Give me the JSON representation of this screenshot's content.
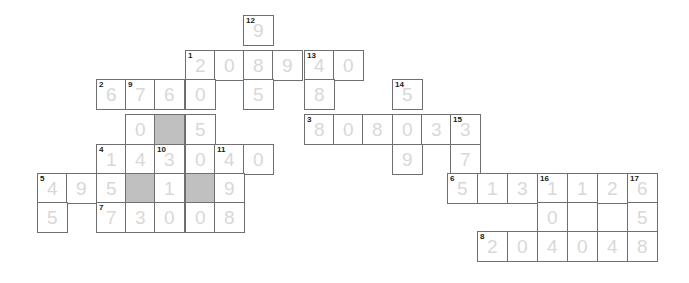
{
  "puzzle": {
    "name": "crossnumber-grid",
    "cell_size": 29.5,
    "colors": {
      "grid_line": "#6f6f6f",
      "digit": "#d8d8d8",
      "clue_number": "#1a1a1a",
      "blocked_cell": "#c0c0c0",
      "background": "#ffffff"
    },
    "cells": [
      {
        "x": 243,
        "y": 15,
        "digit": "9",
        "clue": "12",
        "blocked": false
      },
      {
        "x": 185,
        "y": 50,
        "digit": "2",
        "clue": "1",
        "blocked": false
      },
      {
        "x": 214,
        "y": 50,
        "digit": "0",
        "clue": "",
        "blocked": false
      },
      {
        "x": 243,
        "y": 50,
        "digit": "8",
        "clue": "",
        "blocked": false
      },
      {
        "x": 272,
        "y": 50,
        "digit": "9",
        "clue": "",
        "blocked": false
      },
      {
        "x": 304,
        "y": 50,
        "digit": "4",
        "clue": "13",
        "blocked": false
      },
      {
        "x": 333,
        "y": 50,
        "digit": "0",
        "clue": "",
        "blocked": false
      },
      {
        "x": 96,
        "y": 79,
        "digit": "6",
        "clue": "2",
        "blocked": false
      },
      {
        "x": 125,
        "y": 79,
        "digit": "7",
        "clue": "9",
        "blocked": false
      },
      {
        "x": 154,
        "y": 79,
        "digit": "6",
        "clue": "",
        "blocked": false
      },
      {
        "x": 185,
        "y": 79,
        "digit": "0",
        "clue": "",
        "blocked": false
      },
      {
        "x": 243,
        "y": 79,
        "digit": "5",
        "clue": "",
        "blocked": false
      },
      {
        "x": 304,
        "y": 79,
        "digit": "8",
        "clue": "",
        "blocked": false
      },
      {
        "x": 392,
        "y": 79,
        "digit": "5",
        "clue": "14",
        "blocked": false
      },
      {
        "x": 125,
        "y": 114,
        "digit": "0",
        "clue": "",
        "blocked": false
      },
      {
        "x": 154,
        "y": 114,
        "digit": "",
        "clue": "",
        "blocked": true
      },
      {
        "x": 185,
        "y": 114,
        "digit": "5",
        "clue": "",
        "blocked": false
      },
      {
        "x": 304,
        "y": 114,
        "digit": "8",
        "clue": "3",
        "blocked": false
      },
      {
        "x": 333,
        "y": 114,
        "digit": "0",
        "clue": "",
        "blocked": false
      },
      {
        "x": 362,
        "y": 114,
        "digit": "8",
        "clue": "",
        "blocked": false
      },
      {
        "x": 392,
        "y": 114,
        "digit": "0",
        "clue": "",
        "blocked": false
      },
      {
        "x": 421,
        "y": 114,
        "digit": "3",
        "clue": "",
        "blocked": false
      },
      {
        "x": 450,
        "y": 114,
        "digit": "3",
        "clue": "15",
        "blocked": false
      },
      {
        "x": 96,
        "y": 144,
        "digit": "1",
        "clue": "4",
        "blocked": false
      },
      {
        "x": 125,
        "y": 144,
        "digit": "4",
        "clue": "",
        "blocked": false
      },
      {
        "x": 154,
        "y": 144,
        "digit": "3",
        "clue": "10",
        "blocked": false
      },
      {
        "x": 185,
        "y": 144,
        "digit": "0",
        "clue": "",
        "blocked": false
      },
      {
        "x": 214,
        "y": 144,
        "digit": "4",
        "clue": "11",
        "blocked": false
      },
      {
        "x": 243,
        "y": 144,
        "digit": "0",
        "clue": "",
        "blocked": false
      },
      {
        "x": 392,
        "y": 144,
        "digit": "9",
        "clue": "",
        "blocked": false
      },
      {
        "x": 450,
        "y": 144,
        "digit": "7",
        "clue": "",
        "blocked": false
      },
      {
        "x": 37,
        "y": 173,
        "digit": "4",
        "clue": "5",
        "blocked": false
      },
      {
        "x": 66,
        "y": 173,
        "digit": "9",
        "clue": "",
        "blocked": false
      },
      {
        "x": 96,
        "y": 173,
        "digit": "5",
        "clue": "",
        "blocked": false
      },
      {
        "x": 125,
        "y": 173,
        "digit": "",
        "clue": "",
        "blocked": true
      },
      {
        "x": 154,
        "y": 173,
        "digit": "1",
        "clue": "",
        "blocked": false
      },
      {
        "x": 185,
        "y": 173,
        "digit": "",
        "clue": "",
        "blocked": true
      },
      {
        "x": 214,
        "y": 173,
        "digit": "9",
        "clue": "",
        "blocked": false
      },
      {
        "x": 447,
        "y": 173,
        "digit": "5",
        "clue": "6",
        "blocked": false
      },
      {
        "x": 477,
        "y": 173,
        "digit": "1",
        "clue": "",
        "blocked": false
      },
      {
        "x": 507,
        "y": 173,
        "digit": "3",
        "clue": "",
        "blocked": false
      },
      {
        "x": 537,
        "y": 173,
        "digit": "1",
        "clue": "16",
        "blocked": false
      },
      {
        "x": 567,
        "y": 173,
        "digit": "1",
        "clue": "",
        "blocked": false
      },
      {
        "x": 597,
        "y": 173,
        "digit": "2",
        "clue": "",
        "blocked": false
      },
      {
        "x": 627,
        "y": 173,
        "digit": "6",
        "clue": "17",
        "blocked": false
      },
      {
        "x": 37,
        "y": 202,
        "digit": "5",
        "clue": "",
        "blocked": false
      },
      {
        "x": 96,
        "y": 202,
        "digit": "7",
        "clue": "7",
        "blocked": false
      },
      {
        "x": 125,
        "y": 202,
        "digit": "3",
        "clue": "",
        "blocked": false
      },
      {
        "x": 154,
        "y": 202,
        "digit": "0",
        "clue": "",
        "blocked": false
      },
      {
        "x": 185,
        "y": 202,
        "digit": "0",
        "clue": "",
        "blocked": false
      },
      {
        "x": 214,
        "y": 202,
        "digit": "8",
        "clue": "",
        "blocked": false
      },
      {
        "x": 537,
        "y": 202,
        "digit": "0",
        "clue": "",
        "blocked": false
      },
      {
        "x": 567,
        "y": 202,
        "digit": "",
        "clue": "",
        "blocked": false
      },
      {
        "x": 627,
        "y": 202,
        "digit": "5",
        "clue": "",
        "blocked": false
      },
      {
        "x": 477,
        "y": 231,
        "digit": "2",
        "clue": "8",
        "blocked": false
      },
      {
        "x": 507,
        "y": 231,
        "digit": "0",
        "clue": "",
        "blocked": false
      },
      {
        "x": 537,
        "y": 231,
        "digit": "4",
        "clue": "",
        "blocked": false
      },
      {
        "x": 567,
        "y": 231,
        "digit": "0",
        "clue": "",
        "blocked": false
      },
      {
        "x": 597,
        "y": 231,
        "digit": "4",
        "clue": "",
        "blocked": false
      },
      {
        "x": 627,
        "y": 231,
        "digit": "8",
        "clue": "",
        "blocked": false
      }
    ]
  }
}
